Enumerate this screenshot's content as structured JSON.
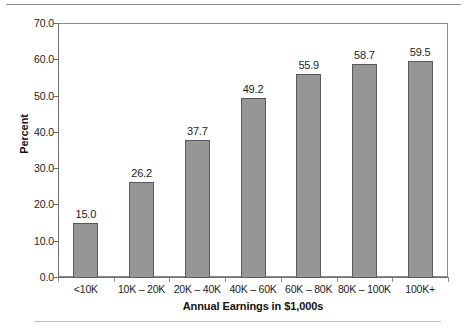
{
  "chart_data": {
    "type": "bar",
    "title": "",
    "xlabel": "Annual Earnings in $1,000s",
    "ylabel": "Percent",
    "categories": [
      "<10K",
      "10K – 20K",
      "20K – 40K",
      "40K – 60K",
      "60K – 80K",
      "80K – 100K",
      "100K+"
    ],
    "values": [
      15.0,
      26.2,
      37.7,
      49.2,
      55.9,
      58.7,
      59.5
    ],
    "value_labels": [
      "15.0",
      "26.2",
      "37.7",
      "49.2",
      "55.9",
      "58.7",
      "59.5"
    ],
    "ylim": [
      0.0,
      70.0
    ],
    "ytick_values": [
      0.0,
      10.0,
      20.0,
      30.0,
      40.0,
      50.0,
      60.0,
      70.0
    ],
    "ytick_labels": [
      "0.0",
      "10.0",
      "20.0",
      "30.0",
      "40.0",
      "50.0",
      "60.0",
      "70.0"
    ],
    "grid": false,
    "legend": false,
    "legend_position": "none",
    "bar_color": "#969696",
    "bar_border_color": "#5a5a5a",
    "axis_color": "#6f6f6f",
    "text_color": "#1c1c1c",
    "background": "#ffffff"
  }
}
